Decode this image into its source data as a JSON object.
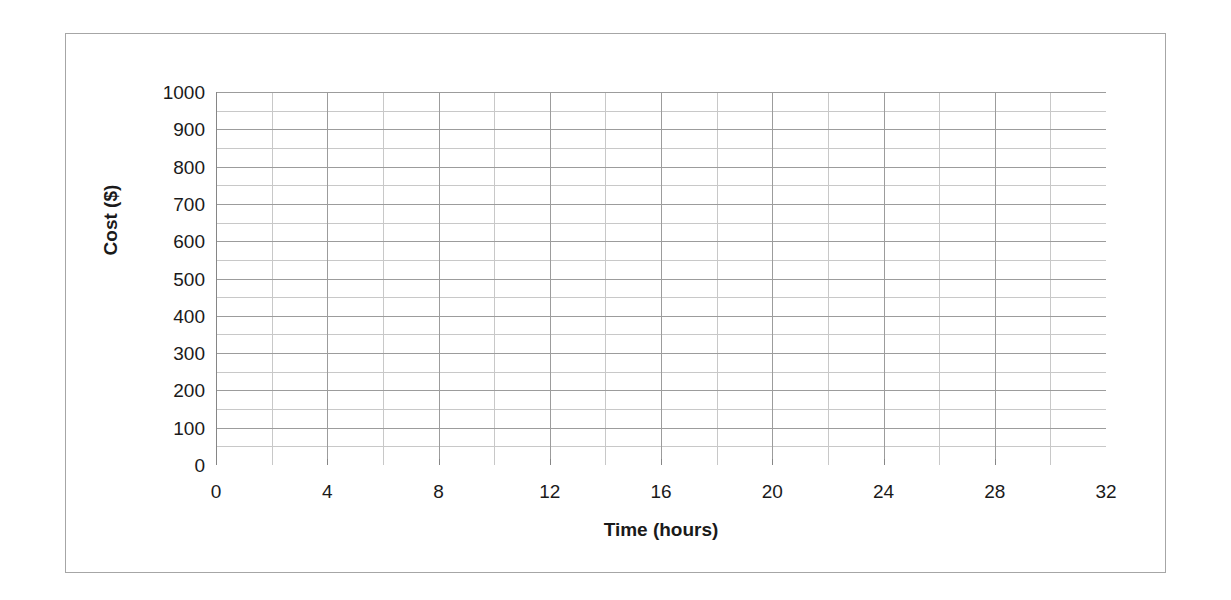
{
  "chart_data": {
    "type": "line",
    "title": "",
    "subtitle": "",
    "xlabel": "Time (hours)",
    "ylabel": "Cost ($)",
    "xlim": [
      0,
      32
    ],
    "ylim": [
      0,
      1000
    ],
    "x_major_ticks": [
      0,
      4,
      8,
      12,
      16,
      20,
      24,
      28,
      32
    ],
    "x_tick_labels": [
      "0",
      "4",
      "8",
      "12",
      "16",
      "20",
      "24",
      "28",
      "32"
    ],
    "x_minor_step": 2,
    "y_major_ticks": [
      0,
      100,
      200,
      300,
      400,
      500,
      600,
      700,
      800,
      900,
      1000
    ],
    "y_tick_labels": [
      "1000",
      "900",
      "800",
      "700",
      "600",
      "500",
      "400",
      "300",
      "200",
      "100",
      "0"
    ],
    "y_minor_step": 50,
    "grid": true,
    "grid_major_x": true,
    "grid_minor_x": true,
    "grid_major_y": true,
    "grid_minor_y": true,
    "legend": false,
    "legend_position": "none",
    "series": [],
    "annotations": [],
    "note": "Empty graph paper / blank plotting grid with no plotted data series"
  },
  "styling": {
    "background_color": "#ffffff",
    "frame_color": "#a6a6a6",
    "axis_line_color": "#868686",
    "grid_major_color": "#9c9c9c",
    "grid_minor_color": "#c8c8c8",
    "tick_color": "#868686",
    "text_color": "#1a1a1a"
  }
}
